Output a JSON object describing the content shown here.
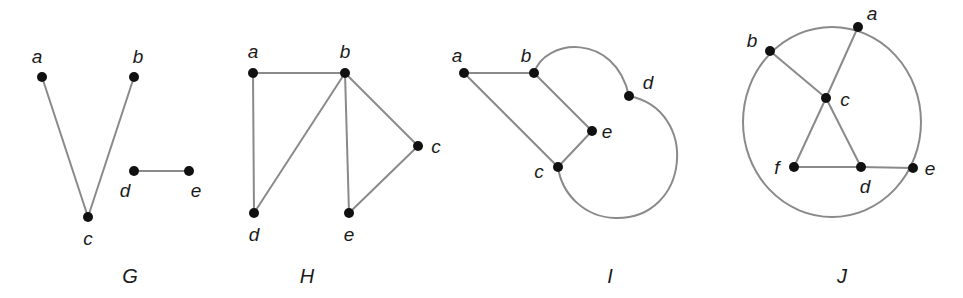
{
  "figure": {
    "colors": {
      "edge": "#8a8a8a",
      "vertex": "#111111",
      "text": "#1a1a1a",
      "background": "#ffffff"
    }
  },
  "graphs": [
    {
      "name": "G",
      "label_pos": [
        130,
        283
      ],
      "vertices": [
        {
          "id": "a",
          "x": 42,
          "y": 77,
          "lx": 37,
          "ly": 63
        },
        {
          "id": "b",
          "x": 134,
          "y": 77,
          "lx": 138,
          "ly": 63
        },
        {
          "id": "c",
          "x": 88,
          "y": 217,
          "lx": 88,
          "ly": 245
        },
        {
          "id": "d",
          "x": 134,
          "y": 171,
          "lx": 125,
          "ly": 197
        },
        {
          "id": "e",
          "x": 189,
          "y": 171,
          "lx": 196,
          "ly": 197
        }
      ],
      "edges": [
        [
          "a",
          "c"
        ],
        [
          "b",
          "c"
        ],
        [
          "d",
          "e"
        ]
      ]
    },
    {
      "name": "H",
      "label_pos": [
        307,
        283
      ],
      "vertices": [
        {
          "id": "a",
          "x": 253,
          "y": 73,
          "lx": 253,
          "ly": 58
        },
        {
          "id": "b",
          "x": 345,
          "y": 73,
          "lx": 345,
          "ly": 58
        },
        {
          "id": "c",
          "x": 418,
          "y": 146,
          "lx": 436,
          "ly": 153
        },
        {
          "id": "d",
          "x": 254,
          "y": 213,
          "lx": 254,
          "ly": 241
        },
        {
          "id": "e",
          "x": 349,
          "y": 213,
          "lx": 349,
          "ly": 241
        }
      ],
      "edges": [
        [
          "a",
          "b"
        ],
        [
          "a",
          "d"
        ],
        [
          "b",
          "d"
        ],
        [
          "b",
          "e"
        ],
        [
          "b",
          "c"
        ],
        [
          "c",
          "e"
        ]
      ]
    },
    {
      "name": "I",
      "label_pos": [
        610,
        283
      ],
      "vertices": [
        {
          "id": "a",
          "x": 464,
          "y": 73,
          "lx": 457,
          "ly": 62
        },
        {
          "id": "b",
          "x": 534,
          "y": 73,
          "lx": 526,
          "ly": 62
        },
        {
          "id": "c",
          "x": 558,
          "y": 167,
          "lx": 539,
          "ly": 178
        },
        {
          "id": "d",
          "x": 629,
          "y": 96,
          "lx": 648,
          "ly": 89
        },
        {
          "id": "e",
          "x": 592,
          "y": 131,
          "lx": 607,
          "ly": 138
        }
      ],
      "edges": [
        [
          "a",
          "b"
        ],
        [
          "a",
          "c"
        ],
        [
          "b",
          "e"
        ],
        [
          "e",
          "c"
        ]
      ],
      "curved_edges": [
        {
          "from": "b",
          "to": "d",
          "path": "M534,73 C545,38 615,32 629,96"
        },
        {
          "from": "d",
          "to": "c",
          "path": "M629,96 C700,110 690,220 615,218 C585,217 562,195 558,167"
        }
      ]
    },
    {
      "name": "J",
      "label_pos": [
        842,
        283
      ],
      "circle": {
        "cx": 832,
        "cy": 122,
        "rx": 89,
        "ry": 95
      },
      "vertices": [
        {
          "id": "a",
          "x": 858,
          "y": 27,
          "lx": 872,
          "ly": 20
        },
        {
          "id": "b",
          "x": 770,
          "y": 51,
          "lx": 752,
          "ly": 47
        },
        {
          "id": "c",
          "x": 826,
          "y": 98,
          "lx": 845,
          "ly": 106
        },
        {
          "id": "f",
          "x": 794,
          "y": 167,
          "lx": 777,
          "ly": 174
        },
        {
          "id": "d",
          "x": 861,
          "y": 167,
          "lx": 865,
          "ly": 193
        },
        {
          "id": "e",
          "x": 913,
          "y": 168,
          "lx": 930,
          "ly": 175
        }
      ],
      "edges": [
        [
          "a",
          "c"
        ],
        [
          "b",
          "c"
        ],
        [
          "c",
          "f"
        ],
        [
          "c",
          "d"
        ],
        [
          "f",
          "d"
        ],
        [
          "d",
          "e"
        ]
      ]
    }
  ]
}
